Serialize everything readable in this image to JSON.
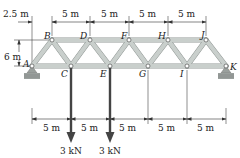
{
  "figure": {
    "type": "plane truss",
    "nodes": [
      "A",
      "B",
      "C",
      "D",
      "E",
      "F",
      "G",
      "H",
      "I",
      "J",
      "K"
    ],
    "top_chord_nodes": [
      "B",
      "D",
      "F",
      "H",
      "J"
    ],
    "bottom_chord_nodes": [
      "A",
      "C",
      "E",
      "G",
      "I",
      "K"
    ],
    "supports": [
      {
        "node": "A",
        "type": "pin"
      },
      {
        "node": "K",
        "type": "pin"
      }
    ],
    "loads": [
      {
        "node": "C",
        "label": "3 kN",
        "direction": "down"
      },
      {
        "node": "E",
        "label": "3 kN",
        "direction": "down"
      }
    ],
    "dimensions": {
      "top": [
        "2.5 m",
        "5 m",
        "5 m",
        "5 m",
        "5 m"
      ],
      "height": "6 m",
      "bottom": [
        "5 m",
        "5 m",
        "5 m",
        "5 m",
        "5 m"
      ]
    },
    "colors": {
      "member_fill": "#c9cfcc",
      "member_edge": "#8f9693",
      "load_arrow": "#444444",
      "support": "#8a8f8c"
    }
  }
}
